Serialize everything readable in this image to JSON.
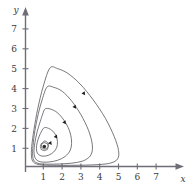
{
  "chart_data": {
    "type": "line",
    "title": "",
    "subtitle": "",
    "xlabel": "x",
    "ylabel": "y",
    "xlim": [
      0,
      7.8
    ],
    "ylim": [
      0,
      7.8
    ],
    "grid": false,
    "legend": null,
    "xticks": [
      1,
      2,
      3,
      4,
      5,
      6,
      7
    ],
    "yticks": [
      1,
      2,
      3,
      4,
      5,
      6,
      7
    ],
    "xtick_labels": [
      "1",
      "2",
      "3",
      "4",
      "5",
      "6",
      "7"
    ],
    "ytick_labels": [
      "1",
      "2",
      "3",
      "4",
      "5",
      "6",
      "7"
    ],
    "annotations": [
      "closed periodic orbits (predator-prey phase portrait)",
      "arrowheads indicate clockwise direction of flow",
      "center equilibrium marked with a dot at (1, 1)"
    ],
    "equilibrium": {
      "x": 1.0,
      "y": 1.0,
      "label": ""
    },
    "series": [
      {
        "name": "orbit-1-innermost",
        "closed": true,
        "arrow_at": {
          "x": 1.32,
          "y": 1.18
        },
        "points": [
          [
            1.0,
            1.28
          ],
          [
            1.1,
            1.26
          ],
          [
            1.18,
            1.2
          ],
          [
            1.22,
            1.1
          ],
          [
            1.2,
            1.0
          ],
          [
            1.13,
            0.92
          ],
          [
            1.03,
            0.88
          ],
          [
            0.93,
            0.9
          ],
          [
            0.86,
            0.97
          ],
          [
            0.85,
            1.07
          ],
          [
            0.89,
            1.17
          ],
          [
            0.96,
            1.25
          ],
          [
            1.0,
            1.28
          ]
        ]
      },
      {
        "name": "orbit-2",
        "closed": true,
        "arrow_at": {
          "x": 1.62,
          "y": 1.5
        },
        "points": [
          [
            1.0,
            1.95
          ],
          [
            1.22,
            1.92
          ],
          [
            1.45,
            1.78
          ],
          [
            1.62,
            1.55
          ],
          [
            1.7,
            1.25
          ],
          [
            1.66,
            0.96
          ],
          [
            1.5,
            0.73
          ],
          [
            1.26,
            0.58
          ],
          [
            1.0,
            0.52
          ],
          [
            0.78,
            0.55
          ],
          [
            0.63,
            0.68
          ],
          [
            0.58,
            0.9
          ],
          [
            0.62,
            1.2
          ],
          [
            0.73,
            1.52
          ],
          [
            0.86,
            1.78
          ],
          [
            1.0,
            1.95
          ]
        ]
      },
      {
        "name": "orbit-3",
        "closed": true,
        "arrow_at": {
          "x": 2.08,
          "y": 2.22
        },
        "points": [
          [
            1.05,
            2.9
          ],
          [
            1.35,
            2.88
          ],
          [
            1.7,
            2.7
          ],
          [
            2.05,
            2.32
          ],
          [
            2.33,
            1.82
          ],
          [
            2.45,
            1.28
          ],
          [
            2.38,
            0.82
          ],
          [
            2.1,
            0.5
          ],
          [
            1.7,
            0.31
          ],
          [
            1.28,
            0.23
          ],
          [
            0.92,
            0.22
          ],
          [
            0.66,
            0.28
          ],
          [
            0.5,
            0.45
          ],
          [
            0.45,
            0.75
          ],
          [
            0.5,
            1.2
          ],
          [
            0.62,
            1.75
          ],
          [
            0.78,
            2.25
          ],
          [
            0.92,
            2.65
          ],
          [
            1.05,
            2.9
          ]
        ]
      },
      {
        "name": "orbit-4",
        "closed": true,
        "arrow_at": {
          "x": 2.62,
          "y": 3.0
        },
        "points": [
          [
            1.15,
            4.0
          ],
          [
            1.5,
            3.98
          ],
          [
            1.95,
            3.78
          ],
          [
            2.45,
            3.3
          ],
          [
            2.95,
            2.6
          ],
          [
            3.35,
            1.82
          ],
          [
            3.55,
            1.12
          ],
          [
            3.5,
            0.62
          ],
          [
            3.18,
            0.33
          ],
          [
            2.7,
            0.2
          ],
          [
            2.1,
            0.14
          ],
          [
            1.5,
            0.12
          ],
          [
            1.0,
            0.12
          ],
          [
            0.66,
            0.16
          ],
          [
            0.46,
            0.28
          ],
          [
            0.38,
            0.55
          ],
          [
            0.4,
            1.05
          ],
          [
            0.5,
            1.8
          ],
          [
            0.68,
            2.65
          ],
          [
            0.9,
            3.4
          ],
          [
            1.15,
            4.0
          ]
        ]
      },
      {
        "name": "orbit-5-outermost",
        "closed": true,
        "arrow_at": {
          "x": 3.1,
          "y": 3.68
        },
        "points": [
          [
            1.3,
            4.95
          ],
          [
            1.7,
            4.92
          ],
          [
            2.25,
            4.68
          ],
          [
            2.9,
            4.15
          ],
          [
            3.6,
            3.35
          ],
          [
            4.25,
            2.42
          ],
          [
            4.72,
            1.5
          ],
          [
            4.95,
            0.8
          ],
          [
            4.9,
            0.38
          ],
          [
            4.55,
            0.18
          ],
          [
            3.95,
            0.1
          ],
          [
            3.2,
            0.07
          ],
          [
            2.4,
            0.06
          ],
          [
            1.65,
            0.06
          ],
          [
            1.05,
            0.07
          ],
          [
            0.66,
            0.11
          ],
          [
            0.42,
            0.22
          ],
          [
            0.32,
            0.48
          ],
          [
            0.33,
            1.0
          ],
          [
            0.45,
            1.85
          ],
          [
            0.65,
            2.9
          ],
          [
            0.95,
            4.05
          ],
          [
            1.3,
            4.95
          ]
        ]
      }
    ],
    "colors": {
      "orbit_stroke": "#55555c",
      "axis": "#6e6e78",
      "text": "#3a3a3a",
      "arrow": "#1e1e1e",
      "background": "#ffffff"
    }
  }
}
